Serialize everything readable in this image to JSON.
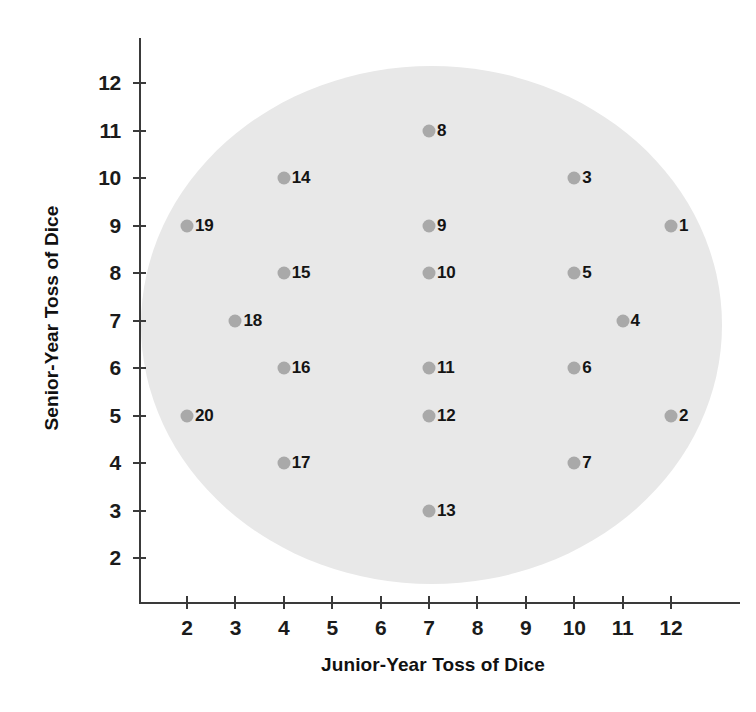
{
  "chart": {
    "type": "scatter",
    "title": "",
    "background_color": "#ffffff",
    "region_color": "#e8e8e8",
    "point_color": "#a9a9a9",
    "axis_color": "#3a3a3a"
  },
  "axes": {
    "x": {
      "title": "Junior-Year Toss of Dice",
      "ticks": [
        "2",
        "3",
        "4",
        "5",
        "6",
        "7",
        "8",
        "9",
        "10",
        "11",
        "12"
      ],
      "min": 2,
      "max": 12
    },
    "y": {
      "title": "Senior-Year Toss of Dice",
      "ticks": [
        "2",
        "3",
        "4",
        "5",
        "6",
        "7",
        "8",
        "9",
        "10",
        "11",
        "12"
      ],
      "min": 2,
      "max": 12
    }
  },
  "chart_data": {
    "type": "scatter",
    "title": "",
    "xlabel": "Junior-Year Toss of Dice",
    "ylabel": "Senior-Year Toss of Dice",
    "xlim": [
      2,
      12
    ],
    "ylim": [
      2,
      12
    ],
    "xticks": [
      2,
      3,
      4,
      5,
      6,
      7,
      8,
      9,
      10,
      11,
      12
    ],
    "yticks": [
      2,
      3,
      4,
      5,
      6,
      7,
      8,
      9,
      10,
      11,
      12
    ],
    "grid": false,
    "legend": "none",
    "annotations": [
      {
        "kind": "ellipse",
        "label": "shaded elliptical region enclosing all points",
        "center_x": 7.05,
        "center_y": 6.9,
        "radius_x": 6.0,
        "radius_y": 5.45,
        "color": "#e8e8e8"
      }
    ],
    "points": [
      {
        "label": "1",
        "x": 12,
        "y": 9
      },
      {
        "label": "2",
        "x": 12,
        "y": 5
      },
      {
        "label": "3",
        "x": 10,
        "y": 10
      },
      {
        "label": "4",
        "x": 11,
        "y": 7
      },
      {
        "label": "5",
        "x": 10,
        "y": 8
      },
      {
        "label": "6",
        "x": 10,
        "y": 6
      },
      {
        "label": "7",
        "x": 10,
        "y": 4
      },
      {
        "label": "8",
        "x": 7,
        "y": 11
      },
      {
        "label": "9",
        "x": 7,
        "y": 9
      },
      {
        "label": "10",
        "x": 7,
        "y": 8
      },
      {
        "label": "11",
        "x": 7,
        "y": 6
      },
      {
        "label": "12",
        "x": 7,
        "y": 5
      },
      {
        "label": "13",
        "x": 7,
        "y": 3
      },
      {
        "label": "14",
        "x": 4,
        "y": 10
      },
      {
        "label": "15",
        "x": 4,
        "y": 8
      },
      {
        "label": "16",
        "x": 4,
        "y": 6
      },
      {
        "label": "17",
        "x": 4,
        "y": 4
      },
      {
        "label": "18",
        "x": 3,
        "y": 7
      },
      {
        "label": "19",
        "x": 2,
        "y": 9
      },
      {
        "label": "20",
        "x": 2,
        "y": 5
      }
    ]
  }
}
